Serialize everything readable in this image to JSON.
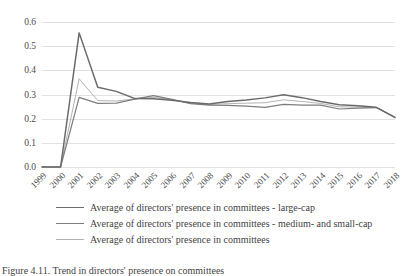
{
  "chart_data": {
    "type": "line",
    "title": "",
    "xlabel": "",
    "ylabel": "",
    "grid": true,
    "legend_position": "bottom",
    "ylim": [
      0.0,
      0.6
    ],
    "y_ticks": [
      "0.0",
      "0.1",
      "0.2",
      "0.3",
      "0.4",
      "0.5",
      "0.6"
    ],
    "y_tick_values": [
      0.0,
      0.1,
      0.2,
      0.3,
      0.4,
      0.5,
      0.6
    ],
    "categories": [
      "1999",
      "2000",
      "2001",
      "2002",
      "2003",
      "2004",
      "2005",
      "2006",
      "2007",
      "2008",
      "2009",
      "2010",
      "2011",
      "2012",
      "2013",
      "2014",
      "2015",
      "2016",
      "2017",
      "2018"
    ],
    "series": [
      {
        "name": "Average of directors' presence in committees - large-cap",
        "color": "#6b6b6b",
        "width": 1.5,
        "values": [
          0.0,
          0.0,
          0.555,
          0.33,
          0.313,
          0.283,
          0.282,
          0.276,
          0.267,
          0.261,
          0.271,
          0.277,
          0.286,
          0.299,
          0.287,
          0.271,
          0.258,
          0.253,
          0.247,
          0.205
        ]
      },
      {
        "name": "Average of directors' presence in committees - medium- and small-cap",
        "color": "#7d7d7d",
        "width": 1.2,
        "values": [
          0.0,
          0.0,
          0.288,
          0.263,
          0.264,
          0.281,
          0.295,
          0.28,
          0.262,
          0.256,
          0.255,
          0.252,
          0.247,
          0.259,
          0.256,
          0.256,
          0.24,
          0.244,
          0.246,
          0.205
        ]
      },
      {
        "name": "Average of directors' presence in committees",
        "color": "#b3b3b3",
        "width": 1.0,
        "values": [
          0.0,
          0.0,
          0.365,
          0.275,
          0.273,
          0.282,
          0.288,
          0.278,
          0.264,
          0.258,
          0.262,
          0.264,
          0.266,
          0.278,
          0.271,
          0.263,
          0.249,
          0.248,
          0.246,
          0.205
        ]
      }
    ]
  },
  "legend": {
    "items": [
      {
        "label": "Average of directors' presence in committees - large-cap"
      },
      {
        "label": "Average of directors' presence in committees - medium- and small-cap"
      },
      {
        "label": "Average of directors' presence in committees"
      }
    ]
  },
  "caption": {
    "text": "Figure 4.11. Trend in directors' presence on committees"
  }
}
